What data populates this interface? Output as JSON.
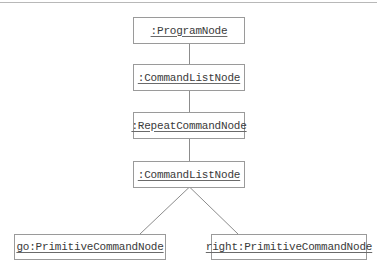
{
  "diagram": {
    "type": "uml-object-diagram",
    "nodes": [
      {
        "id": "program",
        "label": ":ProgramNode"
      },
      {
        "id": "cmdlist1",
        "label": ":CommandListNode"
      },
      {
        "id": "repeat",
        "label": ":RepeatCommandNode"
      },
      {
        "id": "cmdlist2",
        "label": ":CommandListNode"
      },
      {
        "id": "go",
        "label": "go:PrimitiveCommandNode"
      },
      {
        "id": "right",
        "label": "right:PrimitiveCommandNode"
      }
    ],
    "edges": [
      {
        "from": "program",
        "to": "cmdlist1"
      },
      {
        "from": "cmdlist1",
        "to": "repeat"
      },
      {
        "from": "repeat",
        "to": "cmdlist2"
      },
      {
        "from": "cmdlist2",
        "to": "go"
      },
      {
        "from": "cmdlist2",
        "to": "right"
      }
    ],
    "colors": {
      "border": "#9a9a9a",
      "line": "#8c8c8c",
      "text": "#3a3a3a"
    }
  }
}
